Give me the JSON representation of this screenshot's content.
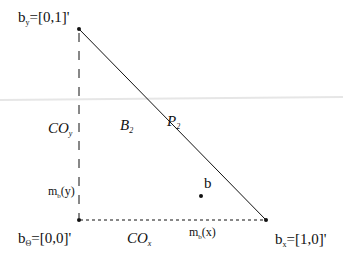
{
  "diagram": {
    "type": "simplex-triangle",
    "colors": {
      "ink": "#111111",
      "background": "#ffffff",
      "faint_line": "#e6e6e6"
    },
    "vertices": {
      "by": {
        "base": "b",
        "sub": "y",
        "value": "=[0,1]'"
      },
      "bo": {
        "base": "b",
        "sub": "Θ",
        "value": "=[0,0]'"
      },
      "bx": {
        "base": "b",
        "sub": "x",
        "value": "=[1,0]'"
      }
    },
    "labels": {
      "P2": {
        "base": "P",
        "sub": "2"
      },
      "B2": {
        "base": "B",
        "sub": "2"
      },
      "COy": {
        "base": "CO",
        "sub": "y"
      },
      "COx": {
        "base": "CO",
        "sub": "x"
      },
      "mby": {
        "base": "m",
        "sub": "b",
        "arg": "(y)"
      },
      "mbx": {
        "base": "m",
        "sub": "b",
        "arg": "(x)"
      },
      "point_b": "b"
    }
  }
}
